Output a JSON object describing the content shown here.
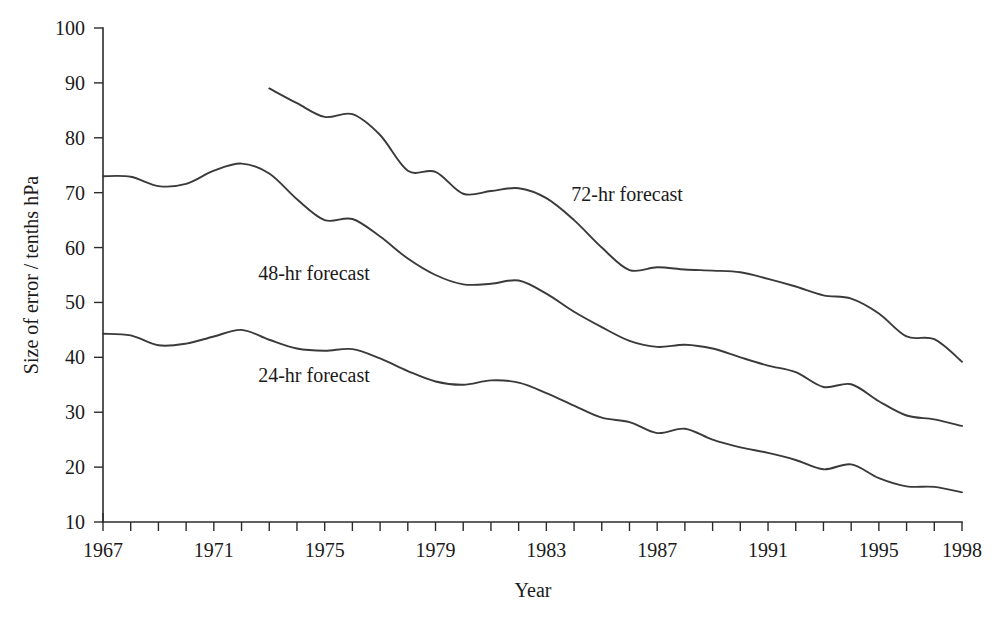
{
  "chart_data": {
    "type": "line",
    "title": "",
    "xlabel": "Year",
    "ylabel": "Size of error / tenths hPa",
    "xlim": [
      1967,
      1998
    ],
    "ylim": [
      10,
      100
    ],
    "grid": false,
    "legend_position": "inline-labels",
    "line_color": "#3a3a3a",
    "axis_color": "#2b2b2b",
    "x_tick_values": [
      1967,
      1968,
      1969,
      1970,
      1971,
      1972,
      1973,
      1974,
      1975,
      1976,
      1977,
      1978,
      1979,
      1980,
      1981,
      1982,
      1983,
      1984,
      1985,
      1986,
      1987,
      1988,
      1989,
      1990,
      1991,
      1992,
      1993,
      1994,
      1995,
      1996,
      1997,
      1998
    ],
    "x_tick_labels": [
      {
        "value": 1967,
        "text": "1967"
      },
      {
        "value": 1971,
        "text": "1971"
      },
      {
        "value": 1975,
        "text": "1975"
      },
      {
        "value": 1979,
        "text": "1979"
      },
      {
        "value": 1983,
        "text": "1983"
      },
      {
        "value": 1987,
        "text": "1987"
      },
      {
        "value": 1991,
        "text": "1991"
      },
      {
        "value": 1995,
        "text": "1995"
      },
      {
        "value": 1998,
        "text": "1998"
      }
    ],
    "y_tick_values": [
      10,
      20,
      30,
      40,
      50,
      60,
      70,
      80,
      90,
      100
    ],
    "y_tick_labels": [
      "10",
      "20",
      "30",
      "40",
      "50",
      "60",
      "70",
      "80",
      "90",
      "100"
    ],
    "series": [
      {
        "name": "72-hr forecast",
        "label": "72-hr forecast",
        "label_x": 1983.9,
        "label_y": 68.5,
        "x": [
          1973,
          1974,
          1975,
          1976,
          1977,
          1978,
          1979,
          1980,
          1981,
          1982,
          1983,
          1984,
          1985,
          1986,
          1987,
          1988,
          1989,
          1990,
          1991,
          1992,
          1993,
          1994,
          1995,
          1996,
          1997,
          1998
        ],
        "values": [
          89.0,
          86.3,
          83.8,
          84.3,
          80.5,
          74.0,
          73.8,
          69.8,
          70.3,
          70.8,
          69.0,
          65.0,
          60.0,
          55.9,
          56.4,
          56.0,
          55.8,
          55.5,
          54.3,
          52.9,
          51.3,
          50.7,
          48.0,
          43.8,
          43.3,
          39.2
        ]
      },
      {
        "name": "48-hr forecast",
        "label": "48-hr forecast",
        "label_x": 1972.6,
        "label_y": 54.0,
        "x": [
          1967,
          1968,
          1969,
          1970,
          1971,
          1972,
          1973,
          1974,
          1975,
          1976,
          1977,
          1978,
          1979,
          1980,
          1981,
          1982,
          1983,
          1984,
          1985,
          1986,
          1987,
          1988,
          1989,
          1990,
          1991,
          1992,
          1993,
          1994,
          1995,
          1996,
          1997,
          1998
        ],
        "values": [
          73.0,
          72.9,
          71.2,
          71.6,
          74.0,
          75.3,
          73.5,
          68.8,
          65.0,
          65.2,
          62.0,
          58.0,
          55.0,
          53.3,
          53.4,
          54.0,
          51.6,
          48.3,
          45.5,
          43.0,
          41.9,
          42.3,
          41.6,
          40.0,
          38.5,
          37.3,
          34.6,
          35.1,
          32.0,
          29.4,
          28.7,
          27.5
        ]
      },
      {
        "name": "24-hr forecast",
        "label": "24-hr forecast",
        "label_x": 1972.6,
        "label_y": 35.5,
        "x": [
          1967,
          1968,
          1969,
          1970,
          1971,
          1972,
          1973,
          1974,
          1975,
          1976,
          1977,
          1978,
          1979,
          1980,
          1981,
          1982,
          1983,
          1984,
          1985,
          1986,
          1987,
          1988,
          1989,
          1990,
          1991,
          1992,
          1993,
          1994,
          1995,
          1996,
          1997,
          1998
        ],
        "values": [
          44.3,
          44.0,
          42.2,
          42.5,
          43.8,
          45.0,
          43.2,
          41.6,
          41.2,
          41.5,
          39.8,
          37.5,
          35.6,
          35.0,
          35.8,
          35.4,
          33.5,
          31.2,
          29.0,
          28.2,
          26.2,
          27.0,
          25.0,
          23.6,
          22.6,
          21.3,
          19.6,
          20.5,
          18.0,
          16.5,
          16.4,
          15.4
        ]
      }
    ]
  },
  "axes": {
    "y_axis_title": "Size of error / tenths hPa",
    "x_axis_title": "Year"
  }
}
